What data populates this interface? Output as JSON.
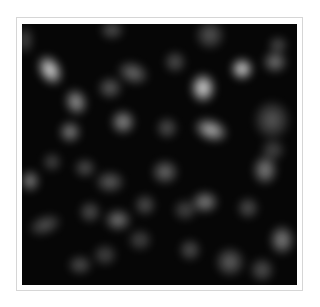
{
  "image": {
    "description": "Grayscale blurred blob texture (Gaussian-smoothed noise) on black background",
    "background_color": "#060606",
    "frame_color": "#d6d6d6",
    "blobs": [
      {
        "x": 50,
        "y": 70,
        "rx": 9,
        "ry": 13,
        "rot": -30,
        "v": 0.95
      },
      {
        "x": 76,
        "y": 102,
        "rx": 9,
        "ry": 11,
        "rot": -20,
        "v": 0.65
      },
      {
        "x": 70,
        "y": 132,
        "rx": 9,
        "ry": 9,
        "rot": 0,
        "v": 0.55
      },
      {
        "x": 123,
        "y": 122,
        "rx": 10,
        "ry": 10,
        "rot": 0,
        "v": 0.6
      },
      {
        "x": 133,
        "y": 73,
        "rx": 13,
        "ry": 9,
        "rot": 20,
        "v": 0.45
      },
      {
        "x": 110,
        "y": 88,
        "rx": 10,
        "ry": 9,
        "rot": 0,
        "v": 0.4
      },
      {
        "x": 112,
        "y": 30,
        "rx": 10,
        "ry": 8,
        "rot": 0,
        "v": 0.35
      },
      {
        "x": 25,
        "y": 40,
        "rx": 7,
        "ry": 12,
        "rot": 0,
        "v": 0.3
      },
      {
        "x": 242,
        "y": 69,
        "rx": 9,
        "ry": 9,
        "rot": 0,
        "v": 0.95
      },
      {
        "x": 203,
        "y": 88,
        "rx": 10,
        "ry": 12,
        "rot": 0,
        "v": 0.95
      },
      {
        "x": 211,
        "y": 130,
        "rx": 14,
        "ry": 9,
        "rot": 20,
        "v": 0.75
      },
      {
        "x": 275,
        "y": 62,
        "rx": 10,
        "ry": 9,
        "rot": 0,
        "v": 0.5
      },
      {
        "x": 278,
        "y": 45,
        "rx": 8,
        "ry": 7,
        "rot": 0,
        "v": 0.35
      },
      {
        "x": 175,
        "y": 62,
        "rx": 9,
        "ry": 9,
        "rot": 0,
        "v": 0.35
      },
      {
        "x": 210,
        "y": 35,
        "rx": 12,
        "ry": 12,
        "rot": 0,
        "v": 0.35
      },
      {
        "x": 167,
        "y": 128,
        "rx": 9,
        "ry": 9,
        "rot": 0,
        "v": 0.35
      },
      {
        "x": 272,
        "y": 120,
        "rx": 15,
        "ry": 16,
        "rot": 0,
        "v": 0.35
      },
      {
        "x": 273,
        "y": 150,
        "rx": 10,
        "ry": 9,
        "rot": 0,
        "v": 0.3
      },
      {
        "x": 30,
        "y": 181,
        "rx": 8,
        "ry": 9,
        "rot": 0,
        "v": 0.55
      },
      {
        "x": 52,
        "y": 162,
        "rx": 8,
        "ry": 8,
        "rot": 0,
        "v": 0.3
      },
      {
        "x": 85,
        "y": 168,
        "rx": 9,
        "ry": 8,
        "rot": 0,
        "v": 0.35
      },
      {
        "x": 110,
        "y": 182,
        "rx": 12,
        "ry": 9,
        "rot": 0,
        "v": 0.4
      },
      {
        "x": 118,
        "y": 220,
        "rx": 11,
        "ry": 9,
        "rot": 0,
        "v": 0.5
      },
      {
        "x": 90,
        "y": 212,
        "rx": 9,
        "ry": 9,
        "rot": 0,
        "v": 0.35
      },
      {
        "x": 45,
        "y": 225,
        "rx": 14,
        "ry": 8,
        "rot": -20,
        "v": 0.35
      },
      {
        "x": 80,
        "y": 265,
        "rx": 10,
        "ry": 8,
        "rot": 0,
        "v": 0.35
      },
      {
        "x": 105,
        "y": 255,
        "rx": 10,
        "ry": 9,
        "rot": 0,
        "v": 0.3
      },
      {
        "x": 140,
        "y": 240,
        "rx": 10,
        "ry": 9,
        "rot": 0,
        "v": 0.3
      },
      {
        "x": 145,
        "y": 205,
        "rx": 9,
        "ry": 9,
        "rot": 0,
        "v": 0.35
      },
      {
        "x": 165,
        "y": 172,
        "rx": 11,
        "ry": 10,
        "rot": 0,
        "v": 0.45
      },
      {
        "x": 205,
        "y": 202,
        "rx": 11,
        "ry": 9,
        "rot": 0,
        "v": 0.55
      },
      {
        "x": 265,
        "y": 170,
        "rx": 10,
        "ry": 12,
        "rot": 0,
        "v": 0.55
      },
      {
        "x": 282,
        "y": 240,
        "rx": 10,
        "ry": 12,
        "rot": 0,
        "v": 0.55
      },
      {
        "x": 248,
        "y": 208,
        "rx": 9,
        "ry": 9,
        "rot": 0,
        "v": 0.35
      },
      {
        "x": 190,
        "y": 250,
        "rx": 9,
        "ry": 9,
        "rot": 0,
        "v": 0.35
      },
      {
        "x": 230,
        "y": 262,
        "rx": 12,
        "ry": 12,
        "rot": 0,
        "v": 0.4
      },
      {
        "x": 262,
        "y": 270,
        "rx": 10,
        "ry": 10,
        "rot": 0,
        "v": 0.35
      },
      {
        "x": 185,
        "y": 210,
        "rx": 10,
        "ry": 9,
        "rot": 0,
        "v": 0.3
      }
    ]
  }
}
